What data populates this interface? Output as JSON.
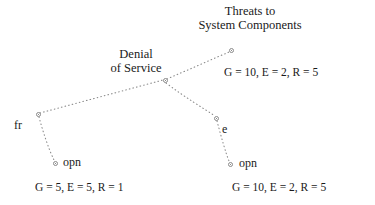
{
  "diagram": {
    "type": "attack-tree",
    "background_color": "#ffffff",
    "text_color": "#1a1a1a",
    "edge_color": "#8a8a8a",
    "edge_style": "dotted",
    "title": {
      "line1": "Threats to",
      "line2": "System Components"
    },
    "nodes": [
      {
        "id": "root",
        "label": "",
        "x": 231,
        "y": 50
      },
      {
        "id": "junction",
        "label": "",
        "x": 165,
        "y": 80
      },
      {
        "id": "left",
        "label": "fr",
        "x": 38,
        "y": 114
      },
      {
        "id": "left-leaf",
        "label": "opn",
        "x": 55,
        "y": 163
      },
      {
        "id": "right",
        "label": "e",
        "x": 216,
        "y": 118
      },
      {
        "id": "right-leaf",
        "label": "opn",
        "x": 230,
        "y": 164
      }
    ],
    "subtree_label": {
      "line1": "Denial",
      "line2": "of Service"
    },
    "annotations": {
      "right_upper": "G = 10, E = 2, R = 5",
      "bottom_left": "G = 5, E = 5, R = 1",
      "bottom_right": "G = 10, E = 2, R = 5"
    },
    "node_labels": {
      "left": "fr",
      "left_leaf": "opn",
      "right": "e",
      "right_leaf": "opn"
    }
  }
}
